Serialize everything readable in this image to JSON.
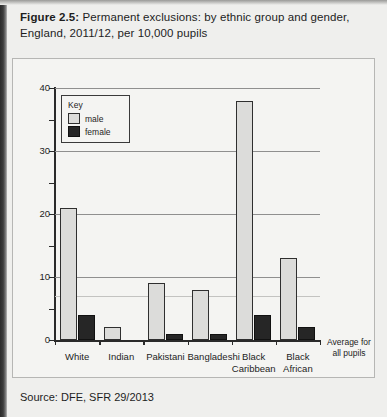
{
  "figure": {
    "number_label": "Figure 2.5:",
    "title_rest": " Permanent exclusions: by ethnic group and gender, England, 2011/12, per 10,000 pupils",
    "source": "Source: DFE, SFR 29/2013"
  },
  "legend": {
    "title": "Key",
    "male_label": "male",
    "female_label": "female",
    "male_color": "#dcdcda",
    "female_color": "#262626"
  },
  "annotation": {
    "line1": "Average for",
    "line2": "all pupils"
  },
  "chart_data": {
    "type": "bar",
    "title": "Figure 2.5: Permanent exclusions: by ethnic group and gender, England, 2011/12, per 10,000 pupils",
    "xlabel": "",
    "ylabel": "",
    "ylim": [
      0,
      40
    ],
    "yticks": [
      0,
      10,
      20,
      30,
      40
    ],
    "yticks_minor": [
      5,
      15,
      25,
      35
    ],
    "ytick_labels": [
      "0",
      "10",
      "20",
      "30",
      "40"
    ],
    "grid": true,
    "legend_position": "inside-top-left",
    "categories": [
      "White",
      "Indian",
      "Pakistani",
      "Bangladeshi",
      "Black Caribbean",
      "Black African"
    ],
    "category_lines": [
      [
        "White"
      ],
      [
        "Indian"
      ],
      [
        "Pakistani"
      ],
      [
        "Bangladeshi"
      ],
      [
        "Black",
        "Caribbean"
      ],
      [
        "Black",
        "African"
      ]
    ],
    "series": [
      {
        "name": "male",
        "color": "#dcdcda",
        "values": [
          21,
          2,
          9,
          8,
          38,
          13
        ]
      },
      {
        "name": "female",
        "color": "#262626",
        "values": [
          4,
          0,
          1,
          1,
          4,
          2
        ]
      }
    ],
    "annotations": [
      {
        "text": "Average for all pupils",
        "y": 7
      }
    ]
  }
}
